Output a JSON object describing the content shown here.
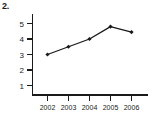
{
  "figure": {
    "number_label": "2."
  },
  "chart_data": {
    "type": "line",
    "title": "",
    "xlabel": "",
    "ylabel": "",
    "categories": [
      "2002",
      "2003",
      "2004",
      "2005",
      "2006"
    ],
    "values": [
      3.0,
      3.5,
      4.0,
      4.8,
      4.45
    ],
    "series": [
      {
        "name": "",
        "values": [
          3.0,
          3.5,
          4.0,
          4.8,
          4.45
        ],
        "color": "#1a1a1a",
        "marker": "filled-diamond"
      }
    ],
    "x_tick_labels": [
      "2002",
      "2003",
      "2004",
      "2005",
      "2006"
    ],
    "y_tick_labels": [
      "1",
      "2",
      "3",
      "4",
      "5"
    ],
    "y_ticks": [
      1,
      2,
      3,
      4,
      5
    ],
    "ylim": [
      0,
      5.6
    ],
    "xlim": [
      0,
      6
    ],
    "grid": false,
    "legend": false,
    "legend_position": "none",
    "background_color": "#ffffff",
    "axis_color": "#1a1a1a"
  }
}
